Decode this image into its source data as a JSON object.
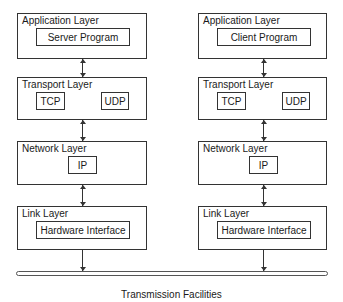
{
  "diagram": {
    "left_stack": {
      "application": {
        "title": "Application Layer",
        "program": "Server Program"
      },
      "transport": {
        "title": "Transport Layer",
        "protocols": [
          "TCP",
          "UDP"
        ]
      },
      "network": {
        "title": "Network Layer",
        "protocol": "IP"
      },
      "link": {
        "title": "Link Layer",
        "interface": "Hardware Interface"
      }
    },
    "right_stack": {
      "application": {
        "title": "Application Layer",
        "program": "Client Program"
      },
      "transport": {
        "title": "Transport Layer",
        "protocols": [
          "TCP",
          "UDP"
        ]
      },
      "network": {
        "title": "Network Layer",
        "protocol": "IP"
      },
      "link": {
        "title": "Link Layer",
        "interface": "Hardware Interface"
      }
    },
    "medium": {
      "label": "Transmission Facilities"
    }
  }
}
